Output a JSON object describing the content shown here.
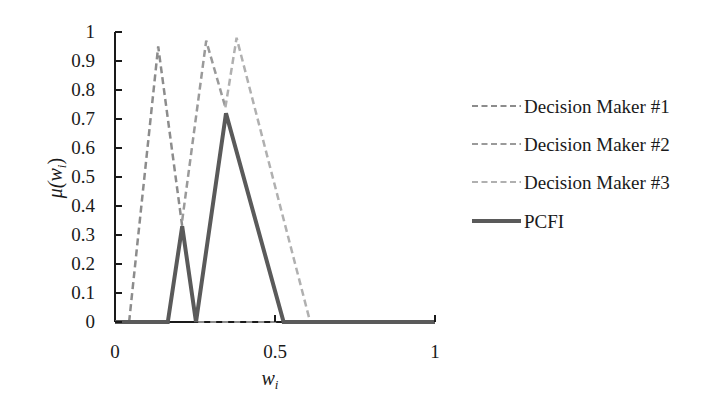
{
  "chart_data": {
    "type": "line",
    "title": "",
    "xlabel": "w_i",
    "ylabel": "μ(w_i)",
    "xlim": [
      0,
      1
    ],
    "ylim": [
      0,
      1
    ],
    "grid": false,
    "legend_position": "right",
    "x_ticks": [
      "0",
      "0.5",
      "1"
    ],
    "y_ticks": [
      "0",
      "0.1",
      "0.2",
      "0.3",
      "0.4",
      "0.5",
      "0.6",
      "0.7",
      "0.8",
      "0.9",
      "1"
    ],
    "series": [
      {
        "name": "Decision Maker #1",
        "style": "dashed",
        "color": "#8c8c8c",
        "x": [
          0.044,
          0.135,
          0.21
        ],
        "y": [
          0.0,
          0.95,
          0.33
        ]
      },
      {
        "name": "Decision Maker #2",
        "style": "dashed",
        "color": "#9a9a9a",
        "x": [
          0.21,
          0.285,
          0.345
        ],
        "y": [
          0.35,
          0.97,
          0.74
        ]
      },
      {
        "name": "Decision Maker #3",
        "style": "dashed",
        "color": "#b0b0b0",
        "x": [
          0.345,
          0.38,
          0.61
        ],
        "y": [
          0.74,
          0.98,
          0.0
        ]
      },
      {
        "name": "PCFI",
        "style": "solid",
        "color": "#5a5a5a",
        "x": [
          0.0,
          0.165,
          0.21,
          0.253,
          0.347,
          0.527,
          1.0
        ],
        "y": [
          0.0,
          0.0,
          0.33,
          0.0,
          0.72,
          0.0,
          0.0
        ]
      }
    ]
  },
  "labels": {
    "ylabel_mu": "μ(",
    "ylabel_w": "w",
    "ylabel_sub": "i",
    "ylabel_close": ")",
    "xlabel_w": "w",
    "xlabel_sub": "i"
  }
}
